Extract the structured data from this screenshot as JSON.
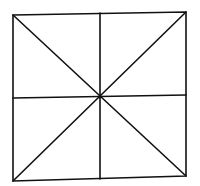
{
  "diagram": {
    "stroke_color": "#111111",
    "background_color": "#ffffff",
    "square": {
      "corners": {
        "top_left": [
          13,
          15
        ],
        "top_right": [
          186,
          12
        ],
        "bottom_right": [
          186,
          176
        ],
        "bottom_left": [
          13,
          181
        ]
      }
    },
    "center": [
      100,
      97
    ],
    "lines": [
      {
        "name": "diagonal-tl-br",
        "from": [
          13,
          15
        ],
        "to": [
          186,
          176
        ]
      },
      {
        "name": "diagonal-tr-bl",
        "from": [
          186,
          12
        ],
        "to": [
          13,
          181
        ]
      },
      {
        "name": "vertical-midline",
        "from": [
          100,
          13
        ],
        "to": [
          100,
          179
        ]
      },
      {
        "name": "horizontal-midline",
        "from": [
          13,
          98
        ],
        "to": [
          186,
          95
        ]
      }
    ]
  }
}
